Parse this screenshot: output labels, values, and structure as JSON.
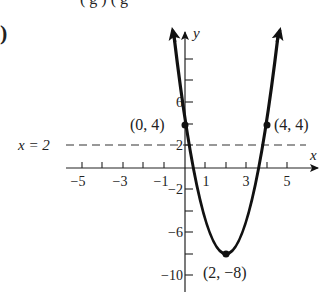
{
  "header": {
    "top_fragment": "( g ) ( g",
    "part_label": ")"
  },
  "graph": {
    "x_axis_label": "x",
    "y_axis_label": "y",
    "asymptote_label": "x = 2",
    "x_tick_labels": [
      "−5",
      "−3",
      "−1",
      "1",
      "3",
      "5"
    ],
    "y_tick_labels": [
      "6",
      "2",
      "−2",
      "−6",
      "−10"
    ],
    "points": [
      {
        "label": "(0, 4)",
        "x": 0,
        "y": 4
      },
      {
        "label": "(4, 4)",
        "x": 4,
        "y": 4
      },
      {
        "label": "(2, −8)",
        "x": 2,
        "y": -8
      }
    ],
    "curve": "y = 3(x − 2)² − 8",
    "line_color": "#111111"
  }
}
